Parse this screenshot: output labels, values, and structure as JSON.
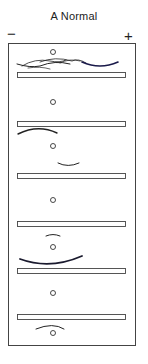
{
  "diagram": {
    "title": "A Normal",
    "left_pole": "−",
    "right_pole": "+",
    "frame": {
      "x": 8,
      "y": 43,
      "w": 127,
      "h": 303
    },
    "bars": [
      {
        "y": 73
      },
      {
        "y": 121
      },
      {
        "y": 173
      },
      {
        "y": 222
      },
      {
        "y": 268
      },
      {
        "y": 315
      }
    ],
    "circles": [
      {
        "cx": 53,
        "cy": 52
      },
      {
        "cx": 53,
        "cy": 102
      },
      {
        "cx": 53,
        "cy": 146
      },
      {
        "cx": 53,
        "cy": 200
      },
      {
        "cx": 53,
        "cy": 247
      },
      {
        "cx": 53,
        "cy": 293
      },
      {
        "cx": 53,
        "cy": 333
      }
    ],
    "colors": {
      "line": "#333333",
      "stroke_dark": "#1a1a2e"
    }
  }
}
